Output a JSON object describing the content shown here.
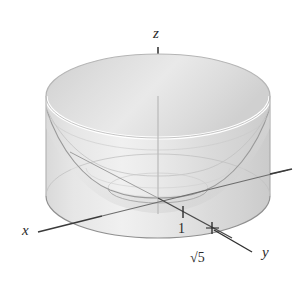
{
  "figure": {
    "kind": "3d-math-diagram",
    "background_color": "#ffffff",
    "axes": [
      {
        "name": "x-axis",
        "label": "x",
        "label_x": 22,
        "label_y": 235
      },
      {
        "name": "y-axis",
        "label": "y",
        "label_x": 262,
        "label_y": 257
      },
      {
        "name": "z-axis",
        "label": "z",
        "label_x": 153,
        "label_y": 38
      }
    ],
    "ticks": [
      {
        "name": "tick-one",
        "label": "1",
        "value": 1,
        "label_x": 178,
        "label_y": 233,
        "mark_x": 183,
        "mark_y": 214
      },
      {
        "name": "tick-sqrt5",
        "label": "√5",
        "value": 2.236,
        "label_x": 190,
        "label_y": 262,
        "mark_x": 212,
        "mark_y": 229
      }
    ],
    "colors": {
      "surface_light": "#f2f2f2",
      "surface_mid": "#dcdcdc",
      "surface_dark": "#c9c9c9",
      "axis_stroke": "#3a3a3a",
      "curve_stroke": "#8c8c8c",
      "outline_stroke": "#a8a8a8",
      "text": "#2b2b2b"
    },
    "geometry": {
      "cylinder_radius_label": "√5",
      "cylinder_center_x": 158,
      "cylinder_top_ellipse_cy": 96,
      "cylinder_bottom_ellipse_cy": 196,
      "cylinder_rx": 112,
      "cylinder_ry": 42,
      "paraboloid_vertex_x": 158,
      "paraboloid_vertex_y": 195
    }
  }
}
